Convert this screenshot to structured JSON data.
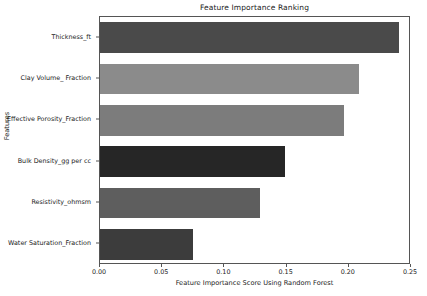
{
  "chart_data": {
    "type": "bar",
    "orientation": "horizontal",
    "title": "Feature Importance Ranking",
    "xlabel": "Feature Importance Score Using Random Forest",
    "ylabel": "Features",
    "categories": [
      "Thickness_ft",
      "Clay Volume_ Fraction",
      "Effective Porosity_Fraction",
      "Bulk Density_gg per cc",
      "Resistivity_ohmsm",
      "Water Saturation_Fraction"
    ],
    "values": [
      0.24,
      0.208,
      0.196,
      0.149,
      0.129,
      0.075
    ],
    "bar_colors": [
      "#4a4a4a",
      "#8b8b8b",
      "#7c7c7c",
      "#262626",
      "#5e5e5e",
      "#3c3c3c"
    ],
    "xlim": [
      0.0,
      0.25
    ],
    "xticks": [
      0.0,
      0.05,
      0.1,
      0.15,
      0.2,
      0.25
    ],
    "xticklabels": [
      "0.00",
      "0.05",
      "0.10",
      "0.15",
      "0.20",
      "0.25"
    ],
    "grid": false,
    "legend": null,
    "axes_edge_color": "#555555",
    "background_color": "#ffffff"
  }
}
